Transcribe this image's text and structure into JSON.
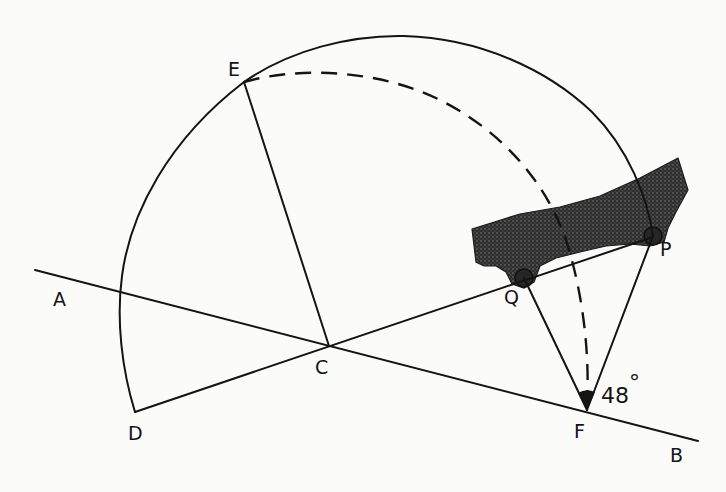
{
  "figure": {
    "kind": "geometric construction",
    "labels": {
      "A": "A",
      "B": "B",
      "C": "C",
      "D": "D",
      "E": "E",
      "F": "F",
      "P": "P",
      "Q": "Q"
    },
    "angle": {
      "vertex": "F",
      "value": "48",
      "unit": "°"
    },
    "colors": {
      "ink": "#141414",
      "background": "#fbfbfa",
      "shaded_region": "#3a3a3a"
    }
  }
}
